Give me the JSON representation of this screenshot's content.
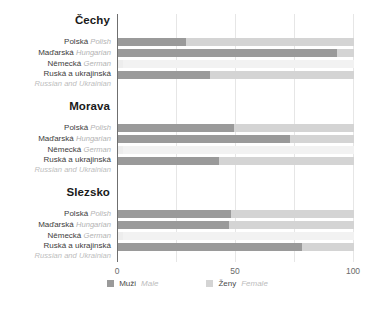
{
  "chart_data": {
    "type": "bar",
    "orientation": "horizontal",
    "stacked": true,
    "title": "",
    "xlabel": "",
    "ylabel": "",
    "xlim": [
      0,
      100
    ],
    "xticks": [
      0,
      50,
      100
    ],
    "xtick_labels": [
      "0",
      "50",
      "100"
    ],
    "gridlines": [
      0,
      25,
      50,
      75,
      100
    ],
    "grid": true,
    "legend_position": "bottom",
    "series": [
      {
        "name": "Muži",
        "name_en": "Male",
        "color": "#9a9a9a"
      },
      {
        "name": "Ženy",
        "name_en": "Female",
        "color": "#d4d4d4"
      }
    ],
    "groups": [
      {
        "title": "Čechy",
        "categories": [
          {
            "cs": "Polská",
            "en": "Polish"
          },
          {
            "cs": "Maďarská",
            "en": "Hungarian"
          },
          {
            "cs": "Německá",
            "en": "German"
          },
          {
            "cs": "Ruská a ukrajinská",
            "en": "Russian and Ukrainian"
          }
        ],
        "male": [
          29,
          93,
          2,
          39
        ],
        "female": [
          71,
          7,
          98,
          61
        ]
      },
      {
        "title": "Morava",
        "categories": [
          {
            "cs": "Polská",
            "en": "Polish"
          },
          {
            "cs": "Maďarská",
            "en": "Hungarian"
          },
          {
            "cs": "Německá",
            "en": "German"
          },
          {
            "cs": "Ruská a ukrajinská",
            "en": "Russian and Ukrainian"
          }
        ],
        "male": [
          49,
          73,
          2,
          43
        ],
        "female": [
          51,
          27,
          98,
          57
        ]
      },
      {
        "title": "Slezsko",
        "categories": [
          {
            "cs": "Polská",
            "en": "Polish"
          },
          {
            "cs": "Maďarská",
            "en": "Hungarian"
          },
          {
            "cs": "Německá",
            "en": "German"
          },
          {
            "cs": "Ruská a ukrajinská",
            "en": "Russian and Ukrainian"
          }
        ],
        "male": [
          48,
          47,
          2,
          78
        ],
        "female": [
          52,
          53,
          98,
          22
        ]
      }
    ]
  },
  "colors": {
    "male": "#9a9a9a",
    "female": "#d4d4d4",
    "faint": "#f2f2f2",
    "grid": "#e6e6e6",
    "axis": "#6f6f6f",
    "label": "#3c3c3c",
    "label_en": "#b3b3b3",
    "title": "#1a1a1a"
  },
  "legend": {
    "male_cs": "Muži",
    "male_en": "Male",
    "female_cs": "Ženy",
    "female_en": "Female"
  }
}
